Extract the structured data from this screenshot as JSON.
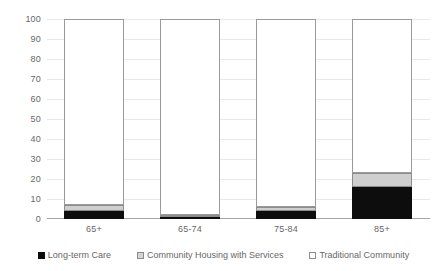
{
  "chart_data": {
    "type": "bar",
    "stacked": true,
    "stack_total": 100,
    "title": "",
    "subtitle": "",
    "xlabel": "",
    "ylabel": "",
    "ylim": [
      0,
      100
    ],
    "ytick_step": 10,
    "yticks": [
      0,
      10,
      20,
      30,
      40,
      50,
      60,
      70,
      80,
      90,
      100
    ],
    "ytick_labels": [
      "0",
      "10",
      "20",
      "30",
      "40",
      "50",
      "60",
      "70",
      "80",
      "90",
      "100"
    ],
    "grid": true,
    "grid_axis": "y",
    "legend_position": "bottom",
    "categories": [
      "65+",
      "65-74",
      "75-84",
      "85+"
    ],
    "series": [
      {
        "name": "Long-term Care",
        "color": "#0d0d0d",
        "values": [
          4,
          1,
          4,
          16
        ]
      },
      {
        "name": "Community Housing with Services",
        "color": "#cfcfcf",
        "values": [
          3,
          1,
          2,
          7
        ]
      },
      {
        "name": "Traditional Community",
        "color": "#ffffff",
        "values": [
          93,
          98,
          94,
          77
        ]
      }
    ]
  },
  "axis": {
    "y_ticks": [
      {
        "value": "100"
      },
      {
        "value": "90"
      },
      {
        "value": "80"
      },
      {
        "value": "70"
      },
      {
        "value": "60"
      },
      {
        "value": "50"
      },
      {
        "value": "40"
      },
      {
        "value": "30"
      },
      {
        "value": "20"
      },
      {
        "value": "10"
      },
      {
        "value": "0"
      }
    ],
    "x_categories": [
      {
        "label": "65+"
      },
      {
        "label": "65-74"
      },
      {
        "label": "75-84"
      },
      {
        "label": "85+"
      }
    ]
  },
  "legend": {
    "items": [
      {
        "label": "Long-term Care",
        "swatch": "black-square-icon"
      },
      {
        "label": "Community Housing with Services",
        "swatch": "gray-square-icon"
      },
      {
        "label": "Traditional Community",
        "swatch": "white-square-icon"
      }
    ]
  }
}
